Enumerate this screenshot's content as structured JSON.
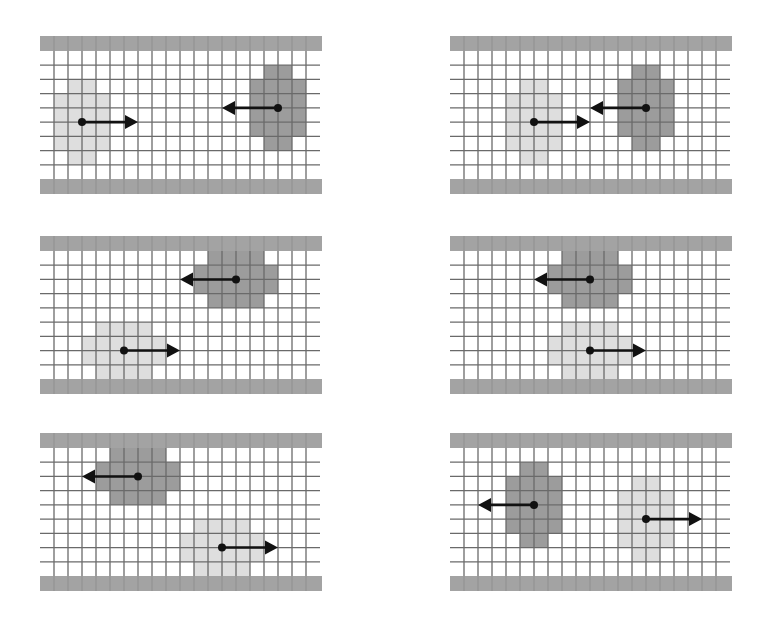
{
  "figure": {
    "grid": {
      "cols": 20,
      "rows": 9,
      "cell_px": 14,
      "wall_px": 15
    },
    "colors": {
      "background": "#ffffff",
      "wall": "#a3a3a3",
      "grid_line": "#6a6a6a",
      "light_blob": "#dedede",
      "dark_blob": "#9c9c9c",
      "dark_blob_border": "#7a7a7a",
      "arrow": "#111111"
    },
    "panels": [
      {
        "id": "panel-1",
        "x": 40,
        "y": 36,
        "blobs": [
          {
            "tone": "light",
            "cells": [
              [
                2,
                2,
                3
              ],
              [
                3,
                1,
                4
              ],
              [
                4,
                1,
                4
              ],
              [
                5,
                1,
                4
              ],
              [
                6,
                1,
                4
              ],
              [
                7,
                2,
                3
              ]
            ],
            "center": [
              3,
              5.0
            ],
            "arrow": {
              "dir": "right",
              "length": 56
            }
          },
          {
            "tone": "dark",
            "cells": [
              [
                1,
                16,
                17
              ],
              [
                2,
                15,
                18
              ],
              [
                3,
                15,
                18
              ],
              [
                4,
                15,
                18
              ],
              [
                5,
                15,
                18
              ],
              [
                6,
                16,
                17
              ]
            ],
            "center": [
              17,
              4.0
            ],
            "arrow": {
              "dir": "left",
              "length": 56
            }
          }
        ]
      },
      {
        "id": "panel-2",
        "x": 450,
        "y": 36,
        "blobs": [
          {
            "tone": "light",
            "cells": [
              [
                2,
                5,
                6
              ],
              [
                3,
                4,
                7
              ],
              [
                4,
                4,
                7
              ],
              [
                5,
                4,
                7
              ],
              [
                6,
                4,
                7
              ],
              [
                7,
                5,
                6
              ]
            ],
            "center": [
              6,
              5.0
            ],
            "arrow": {
              "dir": "right",
              "length": 56
            }
          },
          {
            "tone": "dark",
            "cells": [
              [
                1,
                13,
                14
              ],
              [
                2,
                12,
                15
              ],
              [
                3,
                12,
                15
              ],
              [
                4,
                12,
                15
              ],
              [
                5,
                12,
                15
              ],
              [
                6,
                13,
                14
              ]
            ],
            "center": [
              14,
              4.0
            ],
            "arrow": {
              "dir": "left",
              "length": 56
            }
          }
        ]
      },
      {
        "id": "panel-3",
        "x": 40,
        "y": 236,
        "blobs": [
          {
            "tone": "dark",
            "cells": [
              [
                0,
                12,
                15
              ],
              [
                1,
                11,
                16
              ],
              [
                2,
                11,
                16
              ],
              [
                3,
                12,
                15
              ]
            ],
            "center": [
              14,
              2.0
            ],
            "arrow": {
              "dir": "left",
              "length": 56
            }
          },
          {
            "tone": "light",
            "cells": [
              [
                5,
                4,
                7
              ],
              [
                6,
                3,
                8
              ],
              [
                7,
                3,
                8
              ],
              [
                8,
                4,
                7
              ]
            ],
            "center": [
              6,
              7.0
            ],
            "arrow": {
              "dir": "right",
              "length": 56
            }
          }
        ]
      },
      {
        "id": "panel-4",
        "x": 450,
        "y": 236,
        "blobs": [
          {
            "tone": "dark",
            "cells": [
              [
                0,
                8,
                11
              ],
              [
                1,
                7,
                12
              ],
              [
                2,
                7,
                12
              ],
              [
                3,
                8,
                11
              ]
            ],
            "center": [
              10,
              2.0
            ],
            "arrow": {
              "dir": "left",
              "length": 56
            }
          },
          {
            "tone": "light",
            "cells": [
              [
                5,
                8,
                11
              ],
              [
                6,
                7,
                12
              ],
              [
                7,
                7,
                12
              ],
              [
                8,
                8,
                11
              ]
            ],
            "center": [
              10,
              7.0
            ],
            "arrow": {
              "dir": "right",
              "length": 56
            }
          }
        ]
      },
      {
        "id": "panel-5",
        "x": 40,
        "y": 433,
        "blobs": [
          {
            "tone": "dark",
            "cells": [
              [
                0,
                5,
                8
              ],
              [
                1,
                4,
                9
              ],
              [
                2,
                4,
                9
              ],
              [
                3,
                5,
                8
              ]
            ],
            "center": [
              7,
              2.0
            ],
            "arrow": {
              "dir": "left",
              "length": 56
            }
          },
          {
            "tone": "light",
            "cells": [
              [
                5,
                11,
                14
              ],
              [
                6,
                10,
                15
              ],
              [
                7,
                10,
                15
              ],
              [
                8,
                11,
                14
              ]
            ],
            "center": [
              13,
              7.0
            ],
            "arrow": {
              "dir": "right",
              "length": 56
            }
          }
        ]
      },
      {
        "id": "panel-6",
        "x": 450,
        "y": 433,
        "blobs": [
          {
            "tone": "dark",
            "cells": [
              [
                1,
                5,
                6
              ],
              [
                2,
                4,
                7
              ],
              [
                3,
                4,
                7
              ],
              [
                4,
                4,
                7
              ],
              [
                5,
                4,
                7
              ],
              [
                6,
                5,
                6
              ]
            ],
            "center": [
              6,
              4.0
            ],
            "arrow": {
              "dir": "left",
              "length": 56
            }
          },
          {
            "tone": "light",
            "cells": [
              [
                2,
                13,
                14
              ],
              [
                3,
                12,
                15
              ],
              [
                4,
                12,
                15
              ],
              [
                5,
                12,
                15
              ],
              [
                6,
                12,
                15
              ],
              [
                7,
                13,
                14
              ]
            ],
            "center": [
              14,
              5.0
            ],
            "arrow": {
              "dir": "right",
              "length": 56
            }
          }
        ]
      }
    ]
  }
}
